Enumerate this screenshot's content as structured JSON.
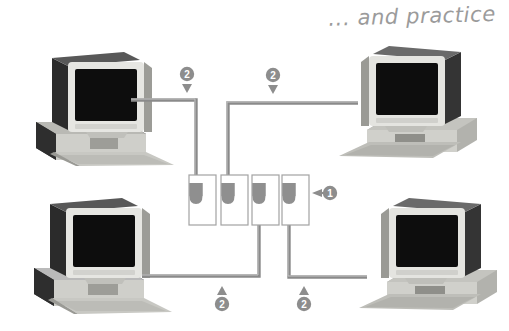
{
  "page": {
    "title": "... and practice",
    "background_color": "#ffffff",
    "diagram_type": "network-topology"
  },
  "colors": {
    "cable": "#8a8a8a",
    "cable_highlight": "#c9c9c9",
    "callout_fill": "#8d8d8d",
    "callout_text": "#ffffff",
    "port_outline": "#9a9a9a",
    "port_plug": "#8f8f8f",
    "title_text": "#9b9b9b",
    "monitor_screen": "#101010",
    "monitor_bezel": "#e3e3e0",
    "case_body": "#d6d6d2",
    "case_dark": "#3a3a3a",
    "keyboard": "#c2c2bd"
  },
  "devices": [
    {
      "id": "pc-top-left",
      "label": "Computer",
      "position": "top-left"
    },
    {
      "id": "pc-top-right",
      "label": "Computer",
      "position": "top-right"
    },
    {
      "id": "pc-bottom-left",
      "label": "Computer",
      "position": "bottom-left"
    },
    {
      "id": "pc-bottom-right",
      "label": "Computer",
      "position": "bottom-right"
    }
  ],
  "hub": {
    "label": "Patch panel",
    "port_count": 4,
    "ports": [
      {
        "index": 1,
        "connected_to": "pc-top-left"
      },
      {
        "index": 2,
        "connected_to": "pc-top-right"
      },
      {
        "index": 3,
        "connected_to": "pc-bottom-left"
      },
      {
        "index": 4,
        "connected_to": "pc-bottom-right"
      }
    ]
  },
  "cables": [
    {
      "id": "cable-top-left",
      "from": "pc-top-left",
      "to": "hub-port-1"
    },
    {
      "id": "cable-top-right",
      "from": "pc-top-right",
      "to": "hub-port-2"
    },
    {
      "id": "cable-bottom-left",
      "from": "pc-bottom-left",
      "to": "hub-port-3"
    },
    {
      "id": "cable-bottom-right",
      "from": "pc-bottom-right",
      "to": "hub-port-4"
    }
  ],
  "callouts": [
    {
      "id": "callout-1",
      "number": "1",
      "arrow": "left",
      "target": "hub"
    },
    {
      "id": "callout-2-topleft",
      "number": "2",
      "arrow": "down",
      "target": "cable-top-left"
    },
    {
      "id": "callout-2-topright",
      "number": "2",
      "arrow": "down",
      "target": "cable-top-right"
    },
    {
      "id": "callout-2-botleft",
      "number": "2",
      "arrow": "up",
      "target": "cable-bottom-left"
    },
    {
      "id": "callout-2-botright",
      "number": "2",
      "arrow": "up",
      "target": "cable-bottom-right"
    }
  ]
}
